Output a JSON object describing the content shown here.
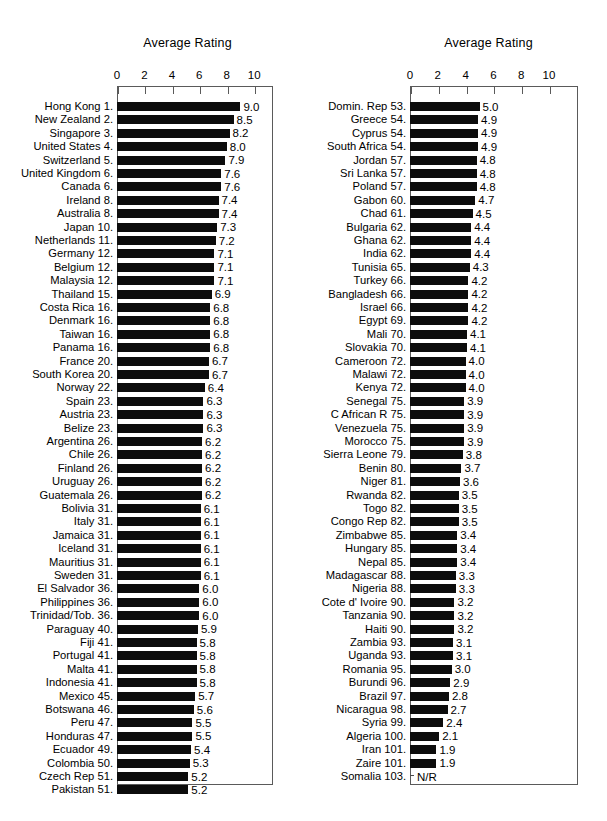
{
  "chart_data": [
    {
      "type": "bar",
      "title": "Average Rating",
      "xlabel": "",
      "ylabel": "",
      "orientation": "horizontal",
      "xlim": [
        0,
        11.3
      ],
      "xticks": [
        0,
        2,
        4,
        6,
        8,
        10
      ],
      "grid": false,
      "legend": null,
      "categories": [
        "Hong Kong 1.",
        "New Zealand 2.",
        "Singapore 3.",
        "United States 4.",
        "Switzerland 5.",
        "United Kingdom 6.",
        "Canada 6.",
        "Ireland 8.",
        "Australia 8.",
        "Japan 10.",
        "Netherlands 11.",
        "Germany 12.",
        "Belgium 12.",
        "Malaysia 12.",
        "Thailand 15.",
        "Costa Rica 16.",
        "Denmark 16.",
        "Taiwan 16.",
        "Panama 16.",
        "France 20.",
        "South Korea 20.",
        "Norway 22.",
        "Spain 23.",
        "Austria 23.",
        "Belize 23.",
        "Argentina 26.",
        "Chile 26.",
        "Finland 26.",
        "Uruguay 26.",
        "Guatemala 26.",
        "Bolivia 31.",
        "Italy 31.",
        "Jamaica 31.",
        "Iceland 31.",
        "Mauritius 31.",
        "Sweden 31.",
        "El Salvador 36.",
        "Philippines 36.",
        "Trinidad/Tob. 36.",
        "Paraguay 40.",
        "Fiji 41.",
        "Portugal 41.",
        "Malta 41.",
        "Indonesia 41.",
        "Mexico 45.",
        "Botswana 46.",
        "Peru 47.",
        "Honduras 47.",
        "Ecuador 49.",
        "Colombia 50.",
        "Czech Rep 51.",
        "Pakistan 51."
      ],
      "values": [
        9.0,
        8.5,
        8.2,
        8.0,
        7.9,
        7.6,
        7.6,
        7.4,
        7.4,
        7.3,
        7.2,
        7.1,
        7.1,
        7.1,
        6.9,
        6.8,
        6.8,
        6.8,
        6.8,
        6.7,
        6.7,
        6.4,
        6.3,
        6.3,
        6.3,
        6.2,
        6.2,
        6.2,
        6.2,
        6.2,
        6.1,
        6.1,
        6.1,
        6.1,
        6.1,
        6.1,
        6.0,
        6.0,
        6.0,
        5.9,
        5.8,
        5.8,
        5.8,
        5.8,
        5.7,
        5.6,
        5.5,
        5.5,
        5.4,
        5.3,
        5.2,
        5.2
      ],
      "value_labels": [
        "9.0",
        "8.5",
        "8.2",
        "8.0",
        "7.9",
        "7.6",
        "7.6",
        "7.4",
        "7.4",
        "7.3",
        "7.2",
        "7.1",
        "7.1",
        "7.1",
        "6.9",
        "6.8",
        "6.8",
        "6.8",
        "6.8",
        "6.7",
        "6.7",
        "6.4",
        "6.3",
        "6.3",
        "6.3",
        "6.2",
        "6.2",
        "6.2",
        "6.2",
        "6.2",
        "6.1",
        "6.1",
        "6.1",
        "6.1",
        "6.1",
        "6.1",
        "6.0",
        "6.0",
        "6.0",
        "5.9",
        "5.8",
        "5.8",
        "5.8",
        "5.8",
        "5.7",
        "5.6",
        "5.5",
        "5.5",
        "5.4",
        "5.3",
        "5.2",
        "5.2"
      ]
    },
    {
      "type": "bar",
      "title": "Average Rating",
      "xlabel": "",
      "ylabel": "",
      "orientation": "horizontal",
      "xlim": [
        0,
        11.3
      ],
      "xticks": [
        0,
        2,
        4,
        6,
        8,
        10
      ],
      "grid": false,
      "legend": null,
      "categories": [
        "Domin. Rep  53.",
        "Greece 54.",
        "Cyprus 54.",
        "South Africa 54.",
        "Jordan 57.",
        "Sri Lanka 57.",
        "Poland 57.",
        "Gabon 60.",
        "Chad 61.",
        "Bulgaria 62.",
        "Ghana 62.",
        "India 62.",
        "Tunisia 65.",
        "Turkey 66.",
        "Bangladesh 66.",
        "Israel 66.",
        "Egypt 69.",
        "Mali 70.",
        "Slovakia 70.",
        "Cameroon 72.",
        "Malawi 72.",
        "Kenya 72.",
        "Senegal 75.",
        "C African R 75.",
        "Venezuela 75.",
        "Morocco 75.",
        "Sierra Leone 79.",
        "Benin 80.",
        "Niger 81.",
        "Rwanda 82.",
        "Togo 82.",
        "Congo Rep 82.",
        "Zimbabwe 85.",
        "Hungary 85.",
        "Nepal 85.",
        "Madagascar 88.",
        "Nigeria 88.",
        "Cote d' Ivoire 90.",
        "Tanzania 90.",
        "Haiti 90.",
        "Zambia 93.",
        "Uganda 93.",
        "Romania 95.",
        "Burundi 96.",
        "Brazil 97.",
        "Nicaragua 98.",
        "Syria 99.",
        "Algeria 100.",
        "Iran 101.",
        "Zaire 101.",
        "Somalia 103."
      ],
      "values": [
        5.0,
        4.9,
        4.9,
        4.9,
        4.8,
        4.8,
        4.8,
        4.7,
        4.5,
        4.4,
        4.4,
        4.4,
        4.3,
        4.2,
        4.2,
        4.2,
        4.2,
        4.1,
        4.1,
        4.0,
        4.0,
        4.0,
        3.9,
        3.9,
        3.9,
        3.9,
        3.8,
        3.7,
        3.6,
        3.5,
        3.5,
        3.5,
        3.4,
        3.4,
        3.4,
        3.3,
        3.3,
        3.2,
        3.2,
        3.2,
        3.1,
        3.1,
        3.0,
        2.9,
        2.8,
        2.7,
        2.4,
        2.1,
        1.9,
        1.9,
        null
      ],
      "value_labels": [
        "5.0",
        "4.9",
        "4.9",
        "4.9",
        "4.8",
        "4.8",
        "4.8",
        "4.7",
        "4.5",
        "4.4",
        "4.4",
        "4.4",
        "4.3",
        "4.2",
        "4.2",
        "4.2",
        "4.2",
        "4.1",
        "4.1",
        "4.0",
        "4.0",
        "4.0",
        "3.9",
        "3.9",
        "3.9",
        "3.9",
        "3.8",
        "3.7",
        "3.6",
        "3.5",
        "3.5",
        "3.5",
        "3.4",
        "3.4",
        "3.4",
        "3.3",
        "3.3",
        "3.2",
        "3.2",
        "3.2",
        "3.1",
        "3.1",
        "3.0",
        "2.9",
        "2.8",
        "2.7",
        "2.4",
        "2.1",
        "1.9",
        "1.9",
        "N/R"
      ]
    }
  ],
  "colors": {
    "bar": "#0c0c0c",
    "frame": "#5a5a5a",
    "text": "#000000",
    "background": "#ffffff"
  },
  "layout": {
    "left": {
      "plot_x": 117,
      "plot_y": 86,
      "plot_w": 156,
      "plot_h": 699,
      "unit_px": 13.72,
      "row_h": 13.4,
      "first_row_y": 101,
      "label_right_px": 113,
      "title_cx": 188
    },
    "right": {
      "plot_x": 410,
      "plot_y": 86,
      "plot_w": 168,
      "plot_h": 699,
      "unit_px": 13.9,
      "row_h": 13.4,
      "first_row_y": 101,
      "label_right_px": 406,
      "title_cx": 480
    }
  }
}
